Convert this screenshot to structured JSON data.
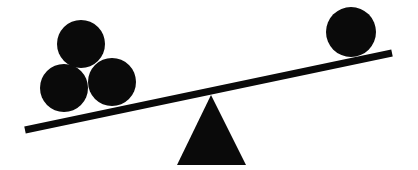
{
  "image": {
    "title": "Seesaw Balance Illustration",
    "alt_text": "A black silhouette seesaw: a straight plank resting on a triangular fulcrum, tilted down to the left where three balls are stacked, with one ball on the raised right end.",
    "canvas": {
      "width": 418,
      "height": 170
    },
    "background_color": "#ffffff",
    "ink_color": "#0a0a0a",
    "style": "flat black silhouette clipart, no outlines, no text"
  },
  "scene": {
    "concept": "lever-imbalance",
    "heavy_side": "left",
    "raised_side": "right",
    "left_ball_count": 3,
    "right_ball_count": 1
  },
  "beam": {
    "name": "seesaw-plank",
    "left_end": {
      "x": 25,
      "y": 130
    },
    "right_end": {
      "x": 392,
      "y": 53
    },
    "thickness": 7,
    "color": "#0a0a0a",
    "tilt_direction": "down-to-the-left"
  },
  "fulcrum": {
    "name": "triangle-fulcrum",
    "shape": "triangle",
    "apex": {
      "x": 211,
      "y": 95
    },
    "base_left": {
      "x": 177,
      "y": 165
    },
    "base_right": {
      "x": 246,
      "y": 165
    },
    "color": "#0a0a0a"
  },
  "balls": [
    {
      "id": "ball-left-top",
      "side": "left",
      "cx": 81,
      "cy": 44,
      "r": 24
    },
    {
      "id": "ball-left-lower",
      "side": "left",
      "cx": 64,
      "cy": 88,
      "r": 24
    },
    {
      "id": "ball-left-middle",
      "side": "left",
      "cx": 112,
      "cy": 82,
      "r": 24
    },
    {
      "id": "ball-right",
      "side": "right",
      "cx": 351,
      "cy": 32,
      "r": 25
    }
  ]
}
